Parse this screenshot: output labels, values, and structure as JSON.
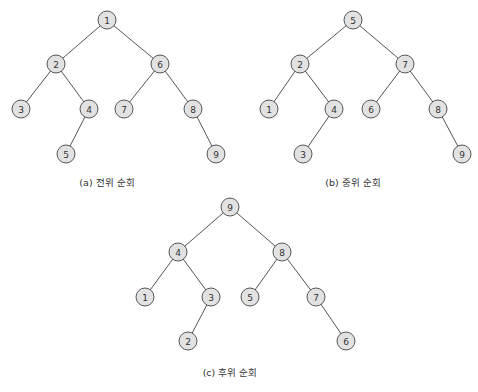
{
  "diagrams": [
    {
      "id": "a",
      "caption": "(a) 전위 순회",
      "caption_pos": [
        107,
        186
      ],
      "nodes": [
        {
          "label": "1",
          "x": 107,
          "y": 20
        },
        {
          "label": "2",
          "x": 56,
          "y": 64
        },
        {
          "label": "6",
          "x": 160,
          "y": 64
        },
        {
          "label": "3",
          "x": 21,
          "y": 109
        },
        {
          "label": "4",
          "x": 89,
          "y": 109
        },
        {
          "label": "7",
          "x": 124,
          "y": 109
        },
        {
          "label": "8",
          "x": 193,
          "y": 109
        },
        {
          "label": "5",
          "x": 66,
          "y": 154
        },
        {
          "label": "9",
          "x": 216,
          "y": 154
        }
      ],
      "edges": [
        [
          0,
          1
        ],
        [
          0,
          2
        ],
        [
          1,
          3
        ],
        [
          1,
          4
        ],
        [
          2,
          5
        ],
        [
          2,
          6
        ],
        [
          4,
          7
        ],
        [
          6,
          8
        ]
      ]
    },
    {
      "id": "b",
      "caption": "(b) 중위 순회",
      "caption_pos": [
        353,
        186
      ],
      "nodes": [
        {
          "label": "5",
          "x": 353,
          "y": 20
        },
        {
          "label": "2",
          "x": 300,
          "y": 64
        },
        {
          "label": "7",
          "x": 405,
          "y": 64
        },
        {
          "label": "1",
          "x": 269,
          "y": 109
        },
        {
          "label": "4",
          "x": 334,
          "y": 109
        },
        {
          "label": "6",
          "x": 371,
          "y": 109
        },
        {
          "label": "8",
          "x": 438,
          "y": 109
        },
        {
          "label": "3",
          "x": 303,
          "y": 154
        },
        {
          "label": "9",
          "x": 462,
          "y": 154
        }
      ],
      "edges": [
        [
          0,
          1
        ],
        [
          0,
          2
        ],
        [
          1,
          3
        ],
        [
          1,
          4
        ],
        [
          2,
          5
        ],
        [
          2,
          6
        ],
        [
          4,
          7
        ],
        [
          6,
          8
        ]
      ]
    },
    {
      "id": "c",
      "caption": "(c) 후위 순회",
      "caption_pos": [
        230,
        376
      ],
      "nodes": [
        {
          "label": "9",
          "x": 230,
          "y": 207
        },
        {
          "label": "4",
          "x": 178,
          "y": 252
        },
        {
          "label": "8",
          "x": 282,
          "y": 252
        },
        {
          "label": "1",
          "x": 145,
          "y": 297
        },
        {
          "label": "3",
          "x": 211,
          "y": 297
        },
        {
          "label": "5",
          "x": 250,
          "y": 297
        },
        {
          "label": "7",
          "x": 316,
          "y": 297
        },
        {
          "label": "2",
          "x": 188,
          "y": 341
        },
        {
          "label": "6",
          "x": 346,
          "y": 341
        }
      ],
      "edges": [
        [
          0,
          1
        ],
        [
          0,
          2
        ],
        [
          1,
          3
        ],
        [
          1,
          4
        ],
        [
          2,
          5
        ],
        [
          2,
          6
        ],
        [
          4,
          7
        ],
        [
          6,
          8
        ]
      ]
    }
  ],
  "style": {
    "node_fill": "#e2e2e2",
    "node_stroke": "#555555",
    "node_radius": 9
  }
}
